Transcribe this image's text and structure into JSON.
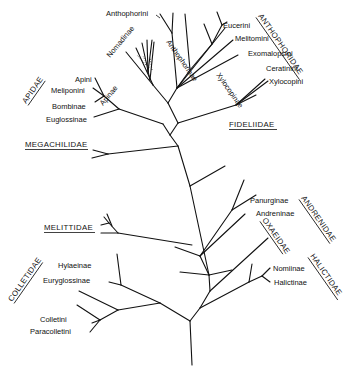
{
  "diagram": {
    "type": "phylogenetic-tree",
    "families": {
      "anthophoridae": "ANTHOPHORIDAE",
      "apidae": "APIDAE",
      "fideliidae": "FIDELIIDAE",
      "megachilidae": "MEGACHILIDAE",
      "andrenidae": "ANDRENIDAE",
      "oxaeidae": "OXAEIDAE",
      "melittidae": "MELITTIDAE",
      "halictidae": "HALICTIDAE",
      "colletidae": "COLLETIDAE"
    },
    "clades": {
      "nomadinae": "Nomadinae",
      "anthophorinae": "Anthophorinae",
      "xylocopinae": "Xylocopinae",
      "apinae": "Apinae"
    },
    "taxa": {
      "anthophorini": "Anthophorini",
      "eucerini": "Eucerini",
      "melitomini": "Melitomini",
      "exomalopsini": "Exomalopsini",
      "ceratinini": "Ceratinini",
      "xylocopini": "Xylocopini",
      "apini": "Apini",
      "meliponini": "Meliponini",
      "bombinae": "Bombinae",
      "euglossinae": "Euglossinae",
      "panurginae": "Panurginae",
      "andreninae": "Andreninae",
      "nomiinae": "Nomiinae",
      "halictinae": "Halictinae",
      "hylaeinae": "Hylaeinae",
      "euryglossinae": "Euryglossinae",
      "colletini": "Colletini",
      "paracolletini": "Paracolletini"
    }
  }
}
